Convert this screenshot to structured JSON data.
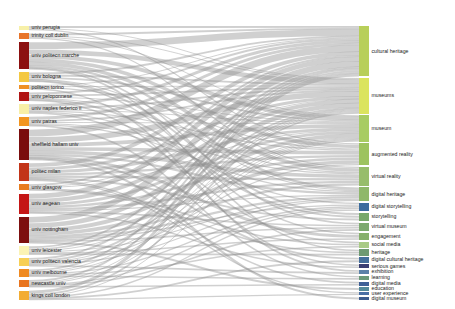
{
  "chart_data": {
    "type": "sankey",
    "title": "",
    "xlabel": "",
    "ylabel": "",
    "legend_position": "none",
    "grid": false,
    "background_color": "#ffffff",
    "link_color": "#8f8f8f",
    "link_opacity": 0.42,
    "source_axis_label": "institution",
    "target_axis_label": "keyword",
    "nodes_left": [
      {
        "id": "univ-perugia",
        "label": "univ perugia",
        "value": 4,
        "color": "#f7f0a8"
      },
      {
        "id": "trinity-coll-dublin",
        "label": "trinity coll dublin",
        "color": "#e8752a",
        "value": 5
      },
      {
        "id": "univ-politecn-marche",
        "label": "univ politecn marche",
        "color": "#8c1010",
        "value": 26
      },
      {
        "id": "univ-bologna",
        "label": "univ bologna",
        "color": "#f4c842",
        "value": 9
      },
      {
        "id": "polimi-polito",
        "label": "politecn torino",
        "color": "#ef9025",
        "value": 4
      },
      {
        "id": "univ-peloponnese",
        "label": "univ peloponnese",
        "color": "#b01414",
        "value": 8
      },
      {
        "id": "univ-naples-federico",
        "label": "univ naples federico ii",
        "color": "#f8efa6",
        "value": 9
      },
      {
        "id": "univ-patras",
        "label": "univ patras",
        "color": "#f2951f",
        "value": 9
      },
      {
        "id": "sheffield-hallam-univ",
        "label": "sheffield hallam univ",
        "color": "#7a0d0d",
        "value": 29
      },
      {
        "id": "politec-milan",
        "label": "politec milan",
        "color": "#c23418",
        "value": 17
      },
      {
        "id": "univ-glasgow",
        "label": "univ glasgow",
        "color": "#e87c1e",
        "value": 6
      },
      {
        "id": "univ-aegean",
        "label": "univ aegean",
        "color": "#c41616",
        "value": 19
      },
      {
        "id": "univ-nottingham",
        "label": "univ nottingham",
        "color": "#7d0f0f",
        "value": 25
      },
      {
        "id": "univ-leicester",
        "label": "univ leicester",
        "color": "#fbf3b4",
        "value": 8
      },
      {
        "id": "univ-politecn-valencia",
        "label": "univ politecn valencia",
        "color": "#f7cf55",
        "value": 8
      },
      {
        "id": "univ-melbourne",
        "label": "univ melbourne",
        "color": "#ef8a22",
        "value": 7
      },
      {
        "id": "newcastle-univ",
        "label": "newcastle univ",
        "color": "#e8751f",
        "value": 7
      },
      {
        "id": "kings-coll-london",
        "label": "kings coll london",
        "color": "#f3ac33",
        "value": 9
      }
    ],
    "nodes_right": [
      {
        "id": "cultural-heritage",
        "label": "cultural heritage",
        "color": "#b8cf5a",
        "value": 48
      },
      {
        "id": "museums",
        "label": "museums",
        "color": "#dbe45e",
        "value": 34
      },
      {
        "id": "museum",
        "label": "museum",
        "color": "#a8cc63",
        "value": 25
      },
      {
        "id": "augmented-reality",
        "label": "augmented reality",
        "color": "#9dc35f",
        "value": 21
      },
      {
        "id": "virtual-reality",
        "label": "virtual reality",
        "color": "#97bd6b",
        "value": 18
      },
      {
        "id": "digital-heritage",
        "label": "digital heritage",
        "color": "#8fb86a",
        "value": 13
      },
      {
        "id": "digital-storytelling",
        "label": "digital storytelling",
        "color": "#3d6c9e",
        "value": 8
      },
      {
        "id": "storytelling",
        "label": "storytelling",
        "color": "#77a86a",
        "value": 8
      },
      {
        "id": "virtual-museum",
        "label": "virtual museum",
        "color": "#7ca96e",
        "value": 8
      },
      {
        "id": "engagement",
        "label": "engagement",
        "color": "#86b06b",
        "value": 7
      },
      {
        "id": "social-media",
        "label": "social media",
        "color": "#a9cb85",
        "value": 6
      },
      {
        "id": "heritage",
        "label": "heritage",
        "color": "#6f9a72",
        "value": 6
      },
      {
        "id": "digital-cultural-heritage",
        "label": "digital cultural heritage",
        "color": "#456f9c",
        "value": 5
      },
      {
        "id": "serious-games",
        "label": "serious games",
        "color": "#3a3f73",
        "value": 4
      },
      {
        "id": "exhibition",
        "label": "exhibition",
        "color": "#5b81a8",
        "value": 4
      },
      {
        "id": "learning",
        "label": "learning",
        "color": "#6b9a79",
        "value": 4
      },
      {
        "id": "digital-media",
        "label": "digital media",
        "color": "#3f5f96",
        "value": 4
      },
      {
        "id": "education",
        "label": "education",
        "color": "#54899a",
        "value": 3
      },
      {
        "id": "user-experience",
        "label": "user experience",
        "color": "#4a6fa5",
        "value": 3
      },
      {
        "id": "digital-museum",
        "label": "digital museum",
        "color": "#3c5b8e",
        "value": 3
      }
    ],
    "links": [
      {
        "source": "univ-perugia",
        "target": "cultural-heritage",
        "value": 2
      },
      {
        "source": "univ-perugia",
        "target": "museums",
        "value": 1
      },
      {
        "source": "univ-perugia",
        "target": "augmented-reality",
        "value": 1
      },
      {
        "source": "trinity-coll-dublin",
        "target": "cultural-heritage",
        "value": 2
      },
      {
        "source": "trinity-coll-dublin",
        "target": "museums",
        "value": 1
      },
      {
        "source": "trinity-coll-dublin",
        "target": "museum",
        "value": 1
      },
      {
        "source": "trinity-coll-dublin",
        "target": "virtual-reality",
        "value": 1
      },
      {
        "source": "univ-politecn-marche",
        "target": "cultural-heritage",
        "value": 7
      },
      {
        "source": "univ-politecn-marche",
        "target": "museums",
        "value": 5
      },
      {
        "source": "univ-politecn-marche",
        "target": "museum",
        "value": 4
      },
      {
        "source": "univ-politecn-marche",
        "target": "augmented-reality",
        "value": 3
      },
      {
        "source": "univ-politecn-marche",
        "target": "virtual-reality",
        "value": 3
      },
      {
        "source": "univ-politecn-marche",
        "target": "digital-heritage",
        "value": 2
      },
      {
        "source": "univ-politecn-marche",
        "target": "virtual-museum",
        "value": 1
      },
      {
        "source": "univ-politecn-marche",
        "target": "heritage",
        "value": 1
      },
      {
        "source": "univ-bologna",
        "target": "cultural-heritage",
        "value": 2
      },
      {
        "source": "univ-bologna",
        "target": "museums",
        "value": 2
      },
      {
        "source": "univ-bologna",
        "target": "museum",
        "value": 2
      },
      {
        "source": "univ-bologna",
        "target": "digital-heritage",
        "value": 1
      },
      {
        "source": "univ-bologna",
        "target": "storytelling",
        "value": 1
      },
      {
        "source": "univ-bologna",
        "target": "engagement",
        "value": 1
      },
      {
        "source": "polimi-polito",
        "target": "cultural-heritage",
        "value": 1
      },
      {
        "source": "polimi-polito",
        "target": "museums",
        "value": 1
      },
      {
        "source": "polimi-polito",
        "target": "augmented-reality",
        "value": 1
      },
      {
        "source": "polimi-polito",
        "target": "exhibition",
        "value": 1
      },
      {
        "source": "univ-peloponnese",
        "target": "cultural-heritage",
        "value": 2
      },
      {
        "source": "univ-peloponnese",
        "target": "museums",
        "value": 2
      },
      {
        "source": "univ-peloponnese",
        "target": "museum",
        "value": 1
      },
      {
        "source": "univ-peloponnese",
        "target": "virtual-reality",
        "value": 1
      },
      {
        "source": "univ-peloponnese",
        "target": "storytelling",
        "value": 1
      },
      {
        "source": "univ-peloponnese",
        "target": "serious-games",
        "value": 1
      },
      {
        "source": "univ-naples-federico",
        "target": "cultural-heritage",
        "value": 3
      },
      {
        "source": "univ-naples-federico",
        "target": "museums",
        "value": 2
      },
      {
        "source": "univ-naples-federico",
        "target": "museum",
        "value": 1
      },
      {
        "source": "univ-naples-federico",
        "target": "augmented-reality",
        "value": 1
      },
      {
        "source": "univ-naples-federico",
        "target": "digital-storytelling",
        "value": 1
      },
      {
        "source": "univ-naples-federico",
        "target": "social-media",
        "value": 1
      },
      {
        "source": "univ-patras",
        "target": "cultural-heritage",
        "value": 3
      },
      {
        "source": "univ-patras",
        "target": "museums",
        "value": 2
      },
      {
        "source": "univ-patras",
        "target": "museum",
        "value": 1
      },
      {
        "source": "univ-patras",
        "target": "virtual-reality",
        "value": 1
      },
      {
        "source": "univ-patras",
        "target": "digital-heritage",
        "value": 1
      },
      {
        "source": "univ-patras",
        "target": "learning",
        "value": 1
      },
      {
        "source": "sheffield-hallam-univ",
        "target": "cultural-heritage",
        "value": 7
      },
      {
        "source": "sheffield-hallam-univ",
        "target": "museums",
        "value": 6
      },
      {
        "source": "sheffield-hallam-univ",
        "target": "museum",
        "value": 4
      },
      {
        "source": "sheffield-hallam-univ",
        "target": "augmented-reality",
        "value": 3
      },
      {
        "source": "sheffield-hallam-univ",
        "target": "virtual-reality",
        "value": 3
      },
      {
        "source": "sheffield-hallam-univ",
        "target": "digital-heritage",
        "value": 2
      },
      {
        "source": "sheffield-hallam-univ",
        "target": "engagement",
        "value": 2
      },
      {
        "source": "sheffield-hallam-univ",
        "target": "digital-cultural-heritage",
        "value": 1
      },
      {
        "source": "sheffield-hallam-univ",
        "target": "digital-museum",
        "value": 1
      },
      {
        "source": "politec-milan",
        "target": "cultural-heritage",
        "value": 4
      },
      {
        "source": "politec-milan",
        "target": "museums",
        "value": 3
      },
      {
        "source": "politec-milan",
        "target": "museum",
        "value": 3
      },
      {
        "source": "politec-milan",
        "target": "augmented-reality",
        "value": 2
      },
      {
        "source": "politec-milan",
        "target": "virtual-reality",
        "value": 2
      },
      {
        "source": "politec-milan",
        "target": "storytelling",
        "value": 1
      },
      {
        "source": "politec-milan",
        "target": "user-experience",
        "value": 1
      },
      {
        "source": "politec-milan",
        "target": "digital-media",
        "value": 1
      },
      {
        "source": "univ-glasgow",
        "target": "cultural-heritage",
        "value": 2
      },
      {
        "source": "univ-glasgow",
        "target": "museums",
        "value": 1
      },
      {
        "source": "univ-glasgow",
        "target": "museum",
        "value": 1
      },
      {
        "source": "univ-glasgow",
        "target": "social-media",
        "value": 1
      },
      {
        "source": "univ-glasgow",
        "target": "heritage",
        "value": 1
      },
      {
        "source": "univ-aegean",
        "target": "cultural-heritage",
        "value": 5
      },
      {
        "source": "univ-aegean",
        "target": "museums",
        "value": 4
      },
      {
        "source": "univ-aegean",
        "target": "museum",
        "value": 3
      },
      {
        "source": "univ-aegean",
        "target": "augmented-reality",
        "value": 2
      },
      {
        "source": "univ-aegean",
        "target": "virtual-reality",
        "value": 2
      },
      {
        "source": "univ-aegean",
        "target": "digital-heritage",
        "value": 1
      },
      {
        "source": "univ-aegean",
        "target": "virtual-museum",
        "value": 1
      },
      {
        "source": "univ-aegean",
        "target": "serious-games",
        "value": 1
      },
      {
        "source": "univ-nottingham",
        "target": "cultural-heritage",
        "value": 6
      },
      {
        "source": "univ-nottingham",
        "target": "museums",
        "value": 5
      },
      {
        "source": "univ-nottingham",
        "target": "museum",
        "value": 4
      },
      {
        "source": "univ-nottingham",
        "target": "augmented-reality",
        "value": 3
      },
      {
        "source": "univ-nottingham",
        "target": "virtual-reality",
        "value": 2
      },
      {
        "source": "univ-nottingham",
        "target": "digital-heritage",
        "value": 2
      },
      {
        "source": "univ-nottingham",
        "target": "digital-storytelling",
        "value": 1
      },
      {
        "source": "univ-nottingham",
        "target": "virtual-museum",
        "value": 1
      },
      {
        "source": "univ-nottingham",
        "target": "education",
        "value": 1
      },
      {
        "source": "univ-leicester",
        "target": "cultural-heritage",
        "value": 2
      },
      {
        "source": "univ-leicester",
        "target": "museums",
        "value": 2
      },
      {
        "source": "univ-leicester",
        "target": "museum",
        "value": 1
      },
      {
        "source": "univ-leicester",
        "target": "digital-heritage",
        "value": 1
      },
      {
        "source": "univ-leicester",
        "target": "engagement",
        "value": 1
      },
      {
        "source": "univ-leicester",
        "target": "heritage",
        "value": 1
      },
      {
        "source": "univ-politecn-valencia",
        "target": "cultural-heritage",
        "value": 2
      },
      {
        "source": "univ-politecn-valencia",
        "target": "museums",
        "value": 2
      },
      {
        "source": "univ-politecn-valencia",
        "target": "museum",
        "value": 1
      },
      {
        "source": "univ-politecn-valencia",
        "target": "augmented-reality",
        "value": 1
      },
      {
        "source": "univ-politecn-valencia",
        "target": "digital-heritage",
        "value": 1
      },
      {
        "source": "univ-politecn-valencia",
        "target": "exhibition",
        "value": 1
      },
      {
        "source": "univ-melbourne",
        "target": "cultural-heritage",
        "value": 2
      },
      {
        "source": "univ-melbourne",
        "target": "museums",
        "value": 1
      },
      {
        "source": "univ-melbourne",
        "target": "museum",
        "value": 1
      },
      {
        "source": "univ-melbourne",
        "target": "digital-storytelling",
        "value": 1
      },
      {
        "source": "univ-melbourne",
        "target": "social-media",
        "value": 1
      },
      {
        "source": "univ-melbourne",
        "target": "learning",
        "value": 1
      },
      {
        "source": "newcastle-univ",
        "target": "cultural-heritage",
        "value": 2
      },
      {
        "source": "newcastle-univ",
        "target": "museums",
        "value": 1
      },
      {
        "source": "newcastle-univ",
        "target": "museum",
        "value": 1
      },
      {
        "source": "newcastle-univ",
        "target": "digital-storytelling",
        "value": 1
      },
      {
        "source": "newcastle-univ",
        "target": "virtual-museum",
        "value": 1
      },
      {
        "source": "newcastle-univ",
        "target": "digital-media",
        "value": 1
      },
      {
        "source": "kings-coll-london",
        "target": "cultural-heritage",
        "value": 3
      },
      {
        "source": "kings-coll-london",
        "target": "museums",
        "value": 2
      },
      {
        "source": "kings-coll-london",
        "target": "museum",
        "value": 1
      },
      {
        "source": "kings-coll-london",
        "target": "digital-cultural-heritage",
        "value": 1
      },
      {
        "source": "kings-coll-london",
        "target": "digital-storytelling",
        "value": 1
      },
      {
        "source": "kings-coll-london",
        "target": "user-experience",
        "value": 1
      }
    ]
  }
}
